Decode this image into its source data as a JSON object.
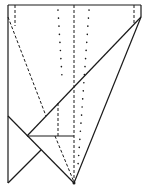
{
  "diagram": {
    "type": "origami-fold-diagram",
    "background": "#ffffff",
    "stroke_color": "#1a1a1a",
    "solid_lines": [
      {
        "name": "top-edge",
        "x1": 8,
        "y1": 5,
        "x2": 141,
        "y2": 5
      },
      {
        "name": "left-edge",
        "x1": 8,
        "y1": 5,
        "x2": 8,
        "y2": 183
      },
      {
        "name": "right-short-edge",
        "x1": 141,
        "y1": 5,
        "x2": 141,
        "y2": 17
      },
      {
        "name": "long-diagonal",
        "x1": 141,
        "y1": 17,
        "x2": 27,
        "y2": 136
      },
      {
        "name": "right-diagonal",
        "x1": 141,
        "y1": 17,
        "x2": 74,
        "y2": 183
      },
      {
        "name": "lower-left-diagonal",
        "x1": 8,
        "y1": 116,
        "x2": 74,
        "y2": 183
      },
      {
        "name": "bottom-left-diagonal",
        "x1": 8,
        "y1": 183,
        "x2": 41,
        "y2": 150
      },
      {
        "name": "horizontal-fold",
        "x1": 27,
        "y1": 136,
        "x2": 74,
        "y2": 136
      }
    ],
    "dashed_lines": [
      {
        "name": "left-short-dashed",
        "x1": 15,
        "y1": 5,
        "x2": 15,
        "y2": 26
      },
      {
        "name": "left-diagonal-dashed",
        "x1": 8,
        "y1": 17,
        "x2": 46,
        "y2": 116
      },
      {
        "name": "center-vertical-dashed",
        "x1": 74,
        "y1": 5,
        "x2": 74,
        "y2": 183
      },
      {
        "name": "right-short-dashed",
        "x1": 134,
        "y1": 5,
        "x2": 134,
        "y2": 25
      },
      {
        "name": "inner-vertical-dashed",
        "x1": 58,
        "y1": 103,
        "x2": 58,
        "y2": 136
      },
      {
        "name": "inner-diagonal-dashed",
        "x1": 55,
        "y1": 136,
        "x2": 74,
        "y2": 182
      }
    ],
    "dotted_lines": [
      {
        "name": "left-dotted",
        "x1": 58,
        "y1": 10,
        "x2": 62,
        "y2": 77
      },
      {
        "name": "right-dotted",
        "x1": 89,
        "y1": 10,
        "x2": 78,
        "y2": 165
      }
    ],
    "points": [
      {
        "name": "bottom-vertex",
        "x": 74,
        "y": 183
      }
    ]
  }
}
